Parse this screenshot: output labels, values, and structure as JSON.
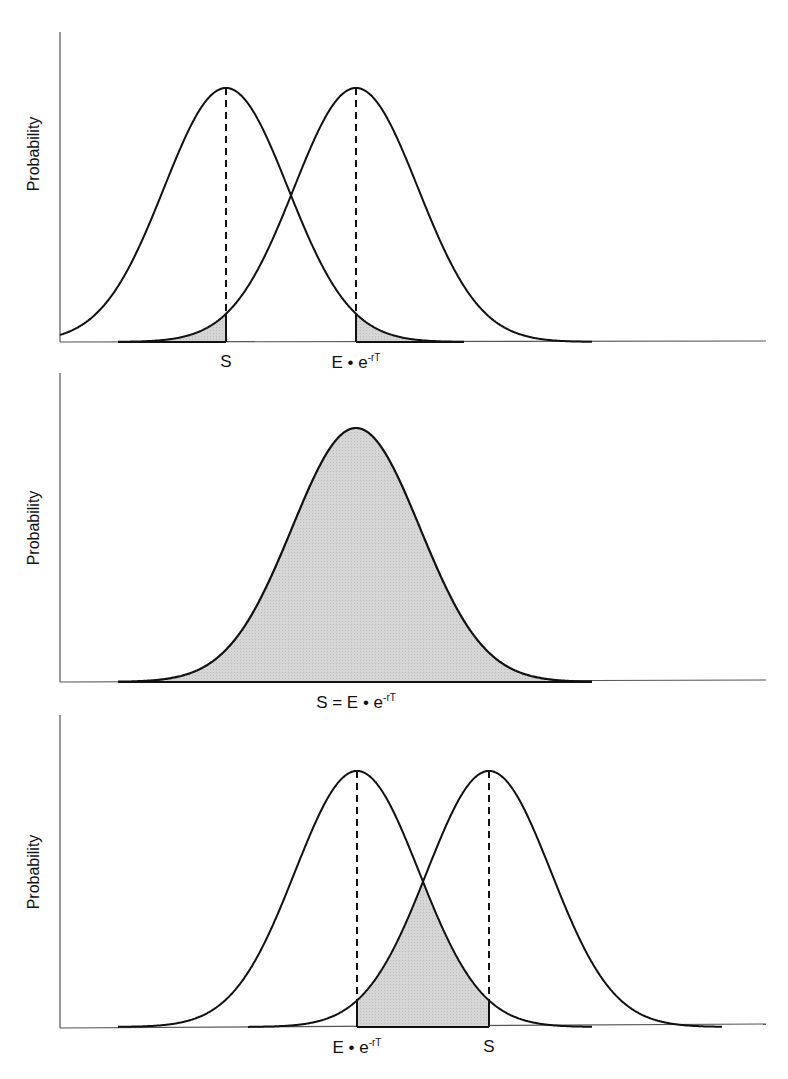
{
  "panels": [
    {
      "id": "top",
      "ylabel": "Probability",
      "labels": [
        {
          "text": "S",
          "x": 226
        },
        {
          "text": "E • e",
          "sup": "-rT",
          "x": 356
        }
      ],
      "description": "Two normal distributions centered at S (left) and E·e^-rT (right); shaded tails beyond each other's mean"
    },
    {
      "id": "middle",
      "ylabel": "Probability",
      "labels": [
        {
          "text": "S = E • e",
          "sup": "-rT",
          "x": 356
        }
      ],
      "description": "Single fully shaded normal distribution where S equals E·e^-rT"
    },
    {
      "id": "bottom",
      "ylabel": "Probability",
      "labels": [
        {
          "text": "E • e",
          "sup": "-rT",
          "x": 357
        },
        {
          "text": "S",
          "x": 489
        }
      ],
      "description": "Two normal distributions centered at E·e^-rT (left) and S (right); shaded region between the means under both curves"
    }
  ],
  "colors": {
    "line": "#111111",
    "fill": "#d2d2d2",
    "axis": "#555555"
  }
}
